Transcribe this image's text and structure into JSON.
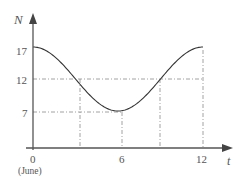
{
  "chart_data": {
    "type": "line",
    "title": "",
    "xlabel": "t",
    "ylabel": "N",
    "x_ticks": [
      "0",
      "6",
      "12"
    ],
    "x_tick_sublabel": "(June)",
    "y_ticks": [
      "7",
      "12",
      "17"
    ],
    "xlim": [
      0,
      12
    ],
    "ylim": [
      0,
      17
    ],
    "grid": false,
    "reference_lines": {
      "horizontal": [
        7,
        12
      ],
      "vertical": [
        3,
        6,
        9,
        12
      ]
    },
    "series": [
      {
        "name": "N(t) = 12 + 5cos(pi t / 6)",
        "x": [
          0,
          1,
          2,
          3,
          4,
          5,
          6,
          7,
          8,
          9,
          10,
          11,
          12
        ],
        "y": [
          17,
          16.33,
          14.5,
          12,
          9.5,
          7.67,
          7,
          7.67,
          9.5,
          12,
          14.5,
          16.33,
          17
        ]
      }
    ]
  },
  "labels": {
    "y_axis": "N",
    "x_axis": "t",
    "tick_17": "17",
    "tick_12": "12",
    "tick_7": "7",
    "tick_0": "0",
    "tick_june": "(June)",
    "tick_6": "6",
    "tick_12x": "12"
  },
  "colors": {
    "axis": "#555555",
    "curve": "#333333",
    "dash": "#888888"
  }
}
